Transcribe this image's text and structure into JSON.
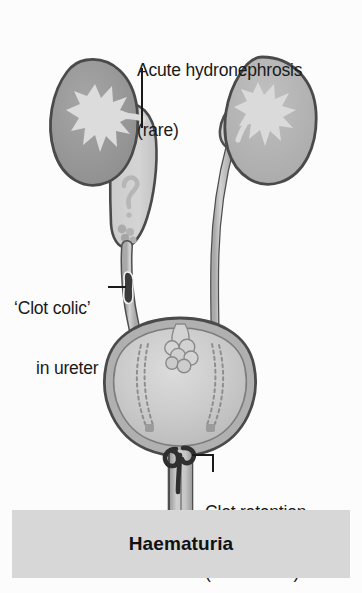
{
  "figure": {
    "title": "Haematuria"
  },
  "labels": {
    "hydronephrosis": "Acute hydronephrosis\n(rare)",
    "hydronephrosis_line1": "Acute hydronephrosis",
    "hydronephrosis_line2": "(rare)",
    "clot_colic": "‘Clot colic’\n   in ureter",
    "clot_colic_line1": "‘Clot colic’",
    "clot_colic_line2": "in ureter",
    "clot_retention": "Clot retention\n(sometimes)",
    "clot_retention_line1": "Clot retention",
    "clot_retention_line2": "(sometimes)"
  },
  "banner": {
    "text": "Haematuria",
    "background": "#d7d7d7",
    "text_color": "#111111"
  },
  "anatomy": {
    "left_kidney": {
      "name": "left kidney",
      "fill": "#9a9a9a",
      "calyx_fill": "#d8d8d8",
      "state": "obstructed, dilated pelvis"
    },
    "right_kidney": {
      "name": "right kidney",
      "fill": "#b5b5b5",
      "calyx_fill": "#d9d9d9",
      "state": "normal"
    },
    "left_ureter": {
      "name": "left ureter",
      "fill": "#c2c2c2",
      "state": "dilated, contains clot"
    },
    "right_ureter": {
      "name": "right ureter",
      "fill": "#cfcfcf",
      "state": "normal"
    },
    "bladder": {
      "name": "urinary bladder",
      "wall_fill": "#b0b0b0",
      "lumen_fill": "#c9c9c9"
    },
    "urethra": {
      "name": "urethra",
      "fill": "#c4c4c4"
    },
    "clots": [
      {
        "name": "renal pelvis clot",
        "shape": "question-mark",
        "color": "#b4b4b4"
      },
      {
        "name": "pelvi-ureteric clot cluster",
        "shape": "granular",
        "color": "#aeaeae"
      },
      {
        "name": "ureteric clot",
        "shape": "elongated",
        "color": "#3a3a3a"
      },
      {
        "name": "bladder dome clot cluster",
        "shape": "grape-cluster",
        "color": "#cdcdcd"
      },
      {
        "name": "bladder neck clot",
        "shape": "comma",
        "color": "#2f2f2f"
      }
    ]
  },
  "colors": {
    "background": "#fcfcfc",
    "outline": "#4a4a4a",
    "text": "#1a1a1a"
  }
}
